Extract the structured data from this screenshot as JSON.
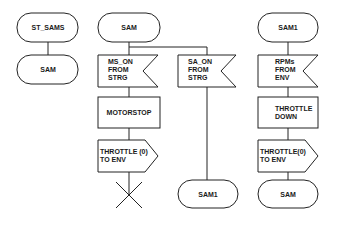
{
  "diagram": {
    "type": "SDL process diagram",
    "col1": {
      "start": "ST_SAMS",
      "state": "SAM"
    },
    "col2": {
      "state": "SAM",
      "branch_left": {
        "input": [
          "MS_ON",
          "FROM",
          "STRG"
        ],
        "task": "MOTORSTOP",
        "output": [
          "THROTTLE (0)",
          "TO ENV"
        ],
        "end": "stop"
      },
      "branch_right": {
        "input": [
          "SA_ON",
          "FROM",
          "STRG"
        ],
        "next_state": "SAM1"
      }
    },
    "col3": {
      "state": "SAM1",
      "input": [
        "RPMs",
        "FROM",
        "ENV"
      ],
      "task": [
        "THROTTLE",
        "DOWN"
      ],
      "output": [
        "THROTTLE(0)",
        "TO ENV"
      ],
      "next_state": "SAM"
    }
  }
}
